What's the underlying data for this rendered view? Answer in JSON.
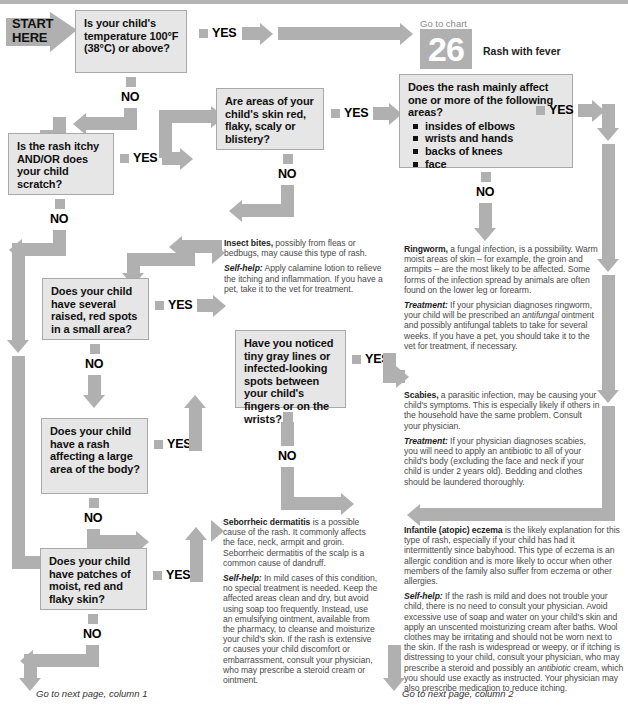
{
  "chart": {
    "start_label_line1": "START",
    "start_label_line2": "HERE",
    "goto_chart_caption": "Go to chart",
    "goto_chart_number": "26",
    "goto_chart_title": "Rash with fever",
    "yes": "YES",
    "no": "NO",
    "footer_left": "Go to next page, column 1",
    "footer_right": "Go to next page, column 2"
  },
  "colors": {
    "connector": "#b0b0b0",
    "box_fill": "#e6e6e6",
    "box_border": "#a9a9a9",
    "advice_text": "#4a4a4a",
    "heading_text": "#1c1c1c",
    "badge_bg": "#b0b0b0"
  },
  "questions": {
    "q1": "Is your child's temperature 100°F (38°C) or above?",
    "q2": "Is the rash itchy AND/OR does your child scratch?",
    "q3": "Are areas of your child's skin red, flaky, scaly or blistery?",
    "q4_intro": "Does the rash mainly affect one or more of the following areas?",
    "q4_bullets": [
      "insides of elbows",
      "wrists and hands",
      "backs of knees",
      "face"
    ],
    "q5": "Does your child have several raised, red spots in a small area?",
    "q6": "Have you noticed tiny gray lines or infected-looking spots between your child's fingers or on the wrists?",
    "q7": "Does your child have a rash affecting a large area of the body?",
    "q8": "Does your child have patches of moist, red and flaky skin?"
  },
  "advice": {
    "insect_bites": {
      "title": "Insect bites,",
      "body": " possibly from fleas or bedbugs, may cause this type of rash.",
      "selfhelp_label": "Self-help:",
      "selfhelp_body": " Apply calamine lotion to relieve the itching and inflammation. If you have a pet, take it to the vet for treatment."
    },
    "ringworm": {
      "title": "Ringworm,",
      "body": " a fungal infection, is a possibility. Warm moist areas of skin – for example, the groin and armpits – are the most likely to be affected. Some forms of the infection spread by animals are often found on the lower leg or forearm.",
      "treatment_label": "Treatment:",
      "treatment_body_1": " If your physician diagnoses ringworm, your child will be prescribed an ",
      "treatment_em": "antifungal",
      "treatment_body_2": " ointment and possibly antifungal tablets to take for several weeks. If you have a pet, you should take it to the vet for treatment, if necessary."
    },
    "scabies": {
      "title": "Scabies,",
      "body": " a parasitic infection, may be causing your child's symptoms. This is especially likely if others in the household have the same problem. Consult your physician.",
      "treatment_label": "Treatment:",
      "treatment_body": " If your physician diagnoses scabies, you will need to apply an antibiotic to all of your child's body (excluding the face and neck if your child is under 2 years old). Bedding and clothes should be laundered thoroughly."
    },
    "seborrheic": {
      "title": "Seborrheic dermatitis",
      "body": " is a possible cause of the rash. It commonly affects the face, neck, armpit and groin. Seborrheic dermatitis of the scalp is a common cause of dandruff.",
      "selfhelp_label": "Self-help:",
      "selfhelp_body": " In mild cases of this condition, no special treatment is needed. Keep the affected areas clean and dry, but avoid using soap too frequently. Instead, use an emulsifying ointment, available from the pharmacy, to cleanse and moisturize your child's skin. If the rash is extensive or causes your child discomfort or embarrassment, consult your physician, who may prescribe a steroid cream or ointment."
    },
    "eczema": {
      "title": "Infantile (atopic) eczema",
      "body": " is the likely explanation for this type of rash, especially if your child has had it intermittently since babyhood. This type of eczema is an allergic condition and is more likely to occur when other members of the family also suffer from eczema or other allergies.",
      "selfhelp_label": "Self-help:",
      "selfhelp_body_1": " If the rash is mild and does not trouble your child, there is no need to consult your physician. Avoid excessive use of soap and water on your child's skin and apply an unscented moisturizing cream after baths. Wool clothes may be irritating and should not be worn next to the skin. If the rash is widespread or weepy, or if itching is distressing to your child, consult your physician, who may prescribe a steroid and possibly an ",
      "selfhelp_em": "antibiotic",
      "selfhelp_body_2": " cream, which you should use exactly as instructed. Your physician may also prescribe medication to reduce itching."
    }
  }
}
